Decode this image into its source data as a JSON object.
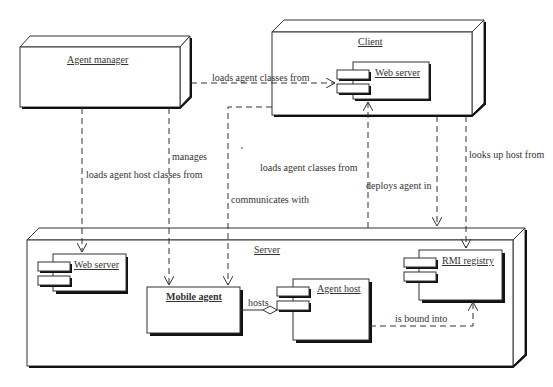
{
  "nodes": {
    "agent_manager": {
      "title": "Agent manager"
    },
    "client": {
      "title": "Client",
      "components": {
        "web_server": {
          "title": "Web server"
        }
      }
    },
    "server": {
      "title": "Server",
      "components": {
        "web_server": {
          "title": "Web server"
        },
        "mobile_agent": {
          "title": "Mobile agent"
        },
        "agent_host": {
          "title": "Agent host"
        },
        "rmi_registry": {
          "title": "RMI registry"
        }
      }
    }
  },
  "edges": {
    "am_loads_from_client_ws": "loads agent classes from",
    "am_loads_host_from_server_ws": "loads agent host classes from",
    "am_manages_mobile_agent": "manages",
    "ma_loads_from_client_ws": "loads agent classes from",
    "ma_communicates_with": "communicates with",
    "server_deploys_agent_in_client": "deploys agent in",
    "client_looks_up_host_from": "looks up host from",
    "agent_host_hosts_mobile_agent": "hosts",
    "agent_host_bound_into_rmi": "is bound into"
  },
  "colors": {
    "line": "#333333",
    "shadow": "#111111",
    "background": "#ffffff"
  }
}
